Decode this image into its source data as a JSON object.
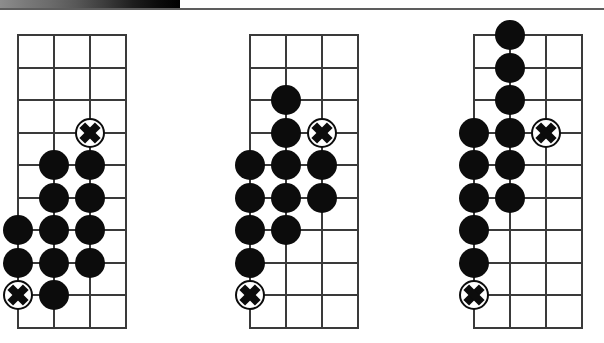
{
  "page": {
    "background_color": "#ffffff",
    "width": 604,
    "height": 343
  },
  "header": {
    "scan_bar_label": "scan-artifact-gradient-bar",
    "scan_rule_label": "page-top-rule",
    "scan_bar": {
      "x": 0,
      "y": 0,
      "width": 180,
      "height": 8,
      "from_color": "#8d8d8d",
      "to_color": "#000000"
    },
    "scan_rule": {
      "x": 0,
      "y": 8,
      "width": 604,
      "height": 2,
      "color": "#5d5d5d"
    }
  },
  "diagram": {
    "kind": "go-board-diagrams",
    "panel_count": 3,
    "grid": {
      "columns": 4,
      "rows": 10,
      "cell_width": 36,
      "cell_height": 32.5,
      "line_color": "#3a3a3a",
      "line_width": 2
    },
    "stone": {
      "diameter": 30,
      "black_color": "#0c0c0c",
      "marked_fill": "#ffffff",
      "marked_stroke": "#0c0c0c",
      "mark_glyph": "X"
    },
    "panels": [
      {
        "name": "panel-1",
        "origin_x": 17,
        "origin_y": 34,
        "stones": [
          {
            "col": 2,
            "row": 3,
            "type": "marked"
          },
          {
            "col": 1,
            "row": 4,
            "type": "black"
          },
          {
            "col": 2,
            "row": 4,
            "type": "black"
          },
          {
            "col": 1,
            "row": 5,
            "type": "black"
          },
          {
            "col": 2,
            "row": 5,
            "type": "black"
          },
          {
            "col": 0,
            "row": 6,
            "type": "black"
          },
          {
            "col": 1,
            "row": 6,
            "type": "black"
          },
          {
            "col": 2,
            "row": 6,
            "type": "black"
          },
          {
            "col": 0,
            "row": 7,
            "type": "black"
          },
          {
            "col": 1,
            "row": 7,
            "type": "black"
          },
          {
            "col": 2,
            "row": 7,
            "type": "black"
          },
          {
            "col": 0,
            "row": 8,
            "type": "marked"
          },
          {
            "col": 1,
            "row": 8,
            "type": "black"
          }
        ]
      },
      {
        "name": "panel-2",
        "origin_x": 249,
        "origin_y": 34,
        "stones": [
          {
            "col": 1,
            "row": 2,
            "type": "black"
          },
          {
            "col": 1,
            "row": 3,
            "type": "black"
          },
          {
            "col": 2,
            "row": 3,
            "type": "marked"
          },
          {
            "col": 0,
            "row": 4,
            "type": "black"
          },
          {
            "col": 1,
            "row": 4,
            "type": "black"
          },
          {
            "col": 2,
            "row": 4,
            "type": "black"
          },
          {
            "col": 0,
            "row": 5,
            "type": "black"
          },
          {
            "col": 1,
            "row": 5,
            "type": "black"
          },
          {
            "col": 2,
            "row": 5,
            "type": "black"
          },
          {
            "col": 0,
            "row": 6,
            "type": "black"
          },
          {
            "col": 1,
            "row": 6,
            "type": "black"
          },
          {
            "col": 0,
            "row": 7,
            "type": "black"
          },
          {
            "col": 0,
            "row": 8,
            "type": "marked"
          }
        ]
      },
      {
        "name": "panel-3",
        "origin_x": 473,
        "origin_y": 34,
        "stones": [
          {
            "col": 1,
            "row": 0,
            "type": "black"
          },
          {
            "col": 1,
            "row": 1,
            "type": "black"
          },
          {
            "col": 1,
            "row": 2,
            "type": "black"
          },
          {
            "col": 0,
            "row": 3,
            "type": "black"
          },
          {
            "col": 1,
            "row": 3,
            "type": "black"
          },
          {
            "col": 2,
            "row": 3,
            "type": "marked"
          },
          {
            "col": 0,
            "row": 4,
            "type": "black"
          },
          {
            "col": 1,
            "row": 4,
            "type": "black"
          },
          {
            "col": 0,
            "row": 5,
            "type": "black"
          },
          {
            "col": 1,
            "row": 5,
            "type": "black"
          },
          {
            "col": 0,
            "row": 6,
            "type": "black"
          },
          {
            "col": 0,
            "row": 7,
            "type": "black"
          },
          {
            "col": 0,
            "row": 8,
            "type": "marked"
          }
        ]
      }
    ]
  }
}
